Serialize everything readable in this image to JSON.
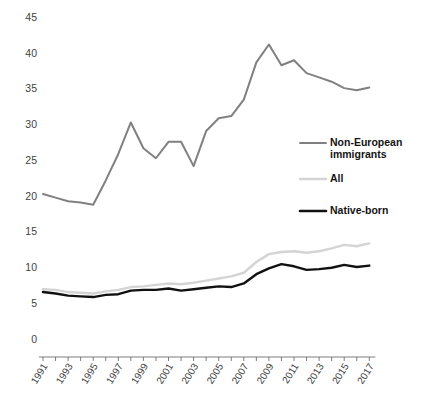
{
  "chart_data": {
    "type": "line",
    "title": "",
    "subtitle": "",
    "xlabel": "",
    "ylabel": "",
    "xlim": [
      1991,
      2017
    ],
    "ylim": [
      0,
      45
    ],
    "yticks": [
      0,
      5,
      10,
      15,
      20,
      25,
      30,
      35,
      40,
      45
    ],
    "ytick_labels": [
      "0",
      "5",
      "10",
      "15",
      "20",
      "25",
      "30",
      "35",
      "40",
      "45"
    ],
    "x": [
      1991,
      1992,
      1993,
      1994,
      1995,
      1996,
      1997,
      1998,
      1999,
      2000,
      2001,
      2002,
      2003,
      2004,
      2005,
      2006,
      2007,
      2008,
      2009,
      2010,
      2011,
      2012,
      2013,
      2014,
      2015,
      2016,
      2017
    ],
    "xtick_labels": [
      "1991",
      "1993",
      "1995",
      "1997",
      "1999",
      "2001",
      "2003",
      "2005",
      "2007",
      "2009",
      "2011",
      "2013",
      "2015",
      "2017"
    ],
    "xticks": [
      1991,
      1993,
      1995,
      1997,
      1999,
      2001,
      2003,
      2005,
      2007,
      2009,
      2011,
      2013,
      2015,
      2017
    ],
    "grid": false,
    "legend_position": "right-middle",
    "series": [
      {
        "name": "Non-European immigrants",
        "color": "#808080",
        "width": 2.0,
        "values": [
          20.4,
          19.9,
          19.4,
          19.2,
          18.9,
          22.3,
          26.0,
          30.4,
          26.8,
          25.4,
          27.7,
          27.7,
          24.3,
          29.2,
          31.0,
          31.3,
          33.6,
          38.8,
          41.3,
          38.4,
          39.1,
          37.3,
          36.7,
          36.1,
          35.2,
          34.9,
          35.3
        ]
      },
      {
        "name": "All",
        "color": "#d4d4d4",
        "width": 2.4,
        "values": [
          7.1,
          7.0,
          6.7,
          6.6,
          6.5,
          6.8,
          7.0,
          7.4,
          7.5,
          7.7,
          7.9,
          7.8,
          8.0,
          8.3,
          8.6,
          8.9,
          9.4,
          10.9,
          12.0,
          12.3,
          12.4,
          12.2,
          12.4,
          12.8,
          13.3,
          13.1,
          13.5
        ]
      },
      {
        "name": "Native-born",
        "color": "#111111",
        "width": 2.4,
        "values": [
          6.7,
          6.5,
          6.2,
          6.1,
          6.0,
          6.3,
          6.4,
          6.9,
          7.0,
          7.0,
          7.2,
          6.9,
          7.1,
          7.3,
          7.5,
          7.4,
          7.9,
          9.2,
          10.0,
          10.6,
          10.3,
          9.8,
          9.9,
          10.1,
          10.5,
          10.2,
          10.4
        ]
      }
    ]
  },
  "legend": {
    "items": [
      {
        "label_line1": "Non-European",
        "label_line2": "immigrants",
        "color": "#808080"
      },
      {
        "label_line1": "All",
        "label_line2": "",
        "color": "#d4d4d4"
      },
      {
        "label_line1": "Native-born",
        "label_line2": "",
        "color": "#111111"
      }
    ]
  },
  "caption": {
    "text": ""
  }
}
